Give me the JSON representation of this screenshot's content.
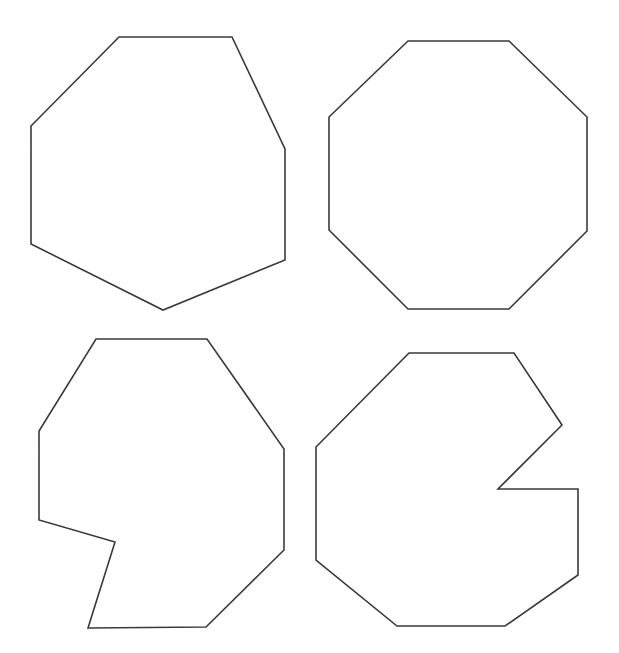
{
  "canvas": {
    "width": 619,
    "height": 653,
    "background": "#ffffff"
  },
  "style": {
    "stroke": "#3a3a3a",
    "fill": "#ffffff",
    "stroke_width": 1.6
  },
  "shapes": [
    {
      "name": "heptagon-irregular",
      "position": "top-left",
      "points": "119,37 232,37 285,149 285,260 163,310 31,244 31,126"
    },
    {
      "name": "octagon-regular",
      "position": "top-right",
      "points": "408,41 509,41 587,117 587,231 509,309 408,309 329,230 329,117"
    },
    {
      "name": "polygon-notched-left",
      "position": "bottom-left",
      "points": "96,339 207,339 284,449 284,550 206,627 88,628 115,542 39,520 39,431"
    },
    {
      "name": "polygon-notched-right",
      "position": "bottom-right",
      "points": "409,353 514,353 562,425 498,489 578,489 578,575 505,626 397,626 316,560 316,447"
    }
  ]
}
